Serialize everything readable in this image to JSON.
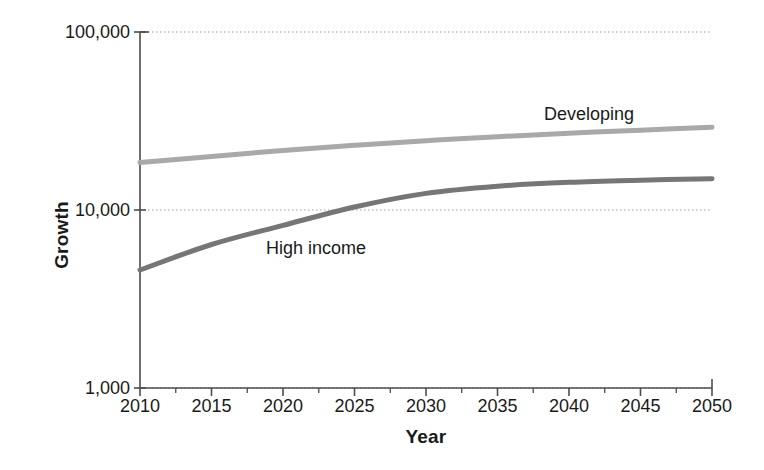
{
  "chart_data": {
    "type": "line",
    "title": "",
    "subtitle": "",
    "xlabel": "Year",
    "ylabel": "Growth",
    "yscale": "log",
    "ylim": [
      1000,
      100000
    ],
    "xlim": [
      2010,
      2050
    ],
    "grid": "horizontal-dotted",
    "legend_position": "inline-annotation",
    "y_ticks": [
      {
        "value": 100000,
        "label": "100,000"
      },
      {
        "value": 10000,
        "label": "10,000"
      },
      {
        "value": 1000,
        "label": "1,000"
      }
    ],
    "x_ticks": [
      {
        "value": 2010,
        "label": "2010"
      },
      {
        "value": 2015,
        "label": "2015"
      },
      {
        "value": 2020,
        "label": "2020"
      },
      {
        "value": 2025,
        "label": "2025"
      },
      {
        "value": 2030,
        "label": "2030"
      },
      {
        "value": 2035,
        "label": "2035"
      },
      {
        "value": 2040,
        "label": "2040"
      },
      {
        "value": 2045,
        "label": "2045"
      },
      {
        "value": 2050,
        "label": "2050"
      }
    ],
    "x_minor_ticks": [
      2012.5,
      2017.5,
      2022.5,
      2027.5,
      2032.5,
      2037.5,
      2042.5,
      2047.5
    ],
    "x": [
      2010,
      2015,
      2020,
      2025,
      2030,
      2035,
      2040,
      2045,
      2050
    ],
    "series": [
      {
        "name": "Developing",
        "color": "#a9a9a9",
        "values": [
          18500,
          20000,
          21600,
          23100,
          24500,
          25800,
          27000,
          28100,
          29200
        ]
      },
      {
        "name": "High income",
        "color": "#767676",
        "values": [
          4600,
          6400,
          8200,
          10400,
          12400,
          13600,
          14300,
          14700,
          15000
        ]
      }
    ],
    "annotations": [
      {
        "text": "Developing",
        "series": "Developing"
      },
      {
        "text": "High income",
        "series": "High income"
      }
    ]
  },
  "colors": {
    "axis": "#4d4d4d",
    "grid": "#9e9e9e",
    "text": "#1a1a1a",
    "developing": "#a9a9a9",
    "high_income": "#767676",
    "background": "#ffffff"
  }
}
